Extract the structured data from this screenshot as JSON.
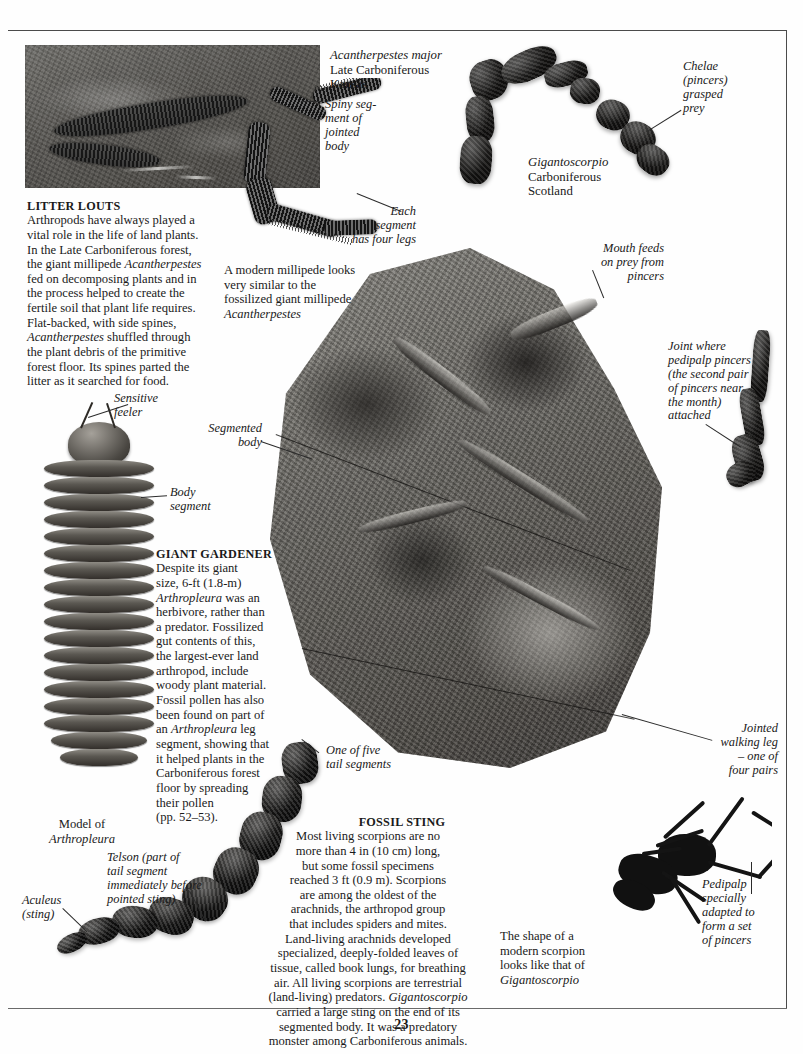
{
  "page": {
    "folio": "23"
  },
  "specimen_labels": {
    "millipede_fossil": {
      "species": "Acantherpestes major",
      "age": "Late Carboniferous",
      "place": "Kansas"
    },
    "scorpion_fossil": {
      "species": "Gigantoscorpio",
      "age": "Carboniferous",
      "place": "Scotland"
    }
  },
  "callouts": {
    "spiny_segment": "Spiny seg-\nment of\njointed\nbody",
    "each_segment": "Each\nsegment\nhas four legs",
    "chelae": "Chelae\n(pincers)\ngrasped\nprey",
    "mouth_feeds": "Mouth feeds\non prey from\npincers",
    "joint_where": "Joint where\npedipalp pincers\n(the second pair\nof pincers near\nthe month)\nattached",
    "sensitive_feeler": "Sensitive\nfeeler",
    "body_segment": "Body\nsegment",
    "segmented_body": "Segmented\nbody",
    "one_of_five": "One of five\ntail segments",
    "jointed_walking_leg": "Jointed\nwalking leg\n– one of\nfour pairs",
    "pedipalp": "Pedipalp\nspecially\nadapted to\nform a set\nof pincers",
    "telson": "Telson (part of\ntail segment\nimmediately before\npointed sting)",
    "aculeus": "Aculeus\n(sting)"
  },
  "captions": {
    "modern_millipede": "A modern millipede looks very similar to the fossilized giant millipede ",
    "modern_millipede_italic": "Acantherpestes",
    "model_of": "Model of",
    "model_of_italic": "Arthropleura",
    "modern_scorpion_shape": "The shape of a modern scorpion looks like that of ",
    "modern_scorpion_shape_italic": "Gigantoscorpio"
  },
  "articles": {
    "litter_louts": {
      "heading": "LITTER LOUTS",
      "lines": [
        "Arthropods have always played a",
        "vital role in the life of land plants.",
        "In the Late Carboniferous forest,",
        "the giant millipede #Acantherpestes#",
        "fed on decomposing plants and in",
        "the process helped to create the",
        "fertile soil that plant life requires.",
        "Flat-backed, with side spines,",
        "#Acantherpestes# shuffled through",
        "the plant debris of the primitive",
        "forest floor. Its spines parted the",
        "litter as it searched for food."
      ]
    },
    "giant_gardener": {
      "heading": "GIANT GARDENER",
      "lines": [
        "Despite its giant",
        "size, 6-ft (1.8-m)",
        "#Arthropleura# was an",
        "herbivore, rather than",
        "a predator. Fossilized",
        "gut contents of this,",
        "the largest-ever land",
        "arthropod, include",
        "woody plant material.",
        "Fossil pollen has also",
        "been found on part of",
        "an #Arthropleura# leg",
        "segment, showing that",
        "it helped plants in the",
        "Carboniferous forest",
        "floor by spreading",
        "their pollen",
        "(pp. 52–53)."
      ]
    },
    "fossil_sting": {
      "heading": "FOSSIL STING",
      "lines": [
        "Most living scorpions are no",
        "more than 4 in (10 cm) long,",
        "but some fossil specimens",
        "reached 3 ft (0.9 m). Scorpions",
        "are among the oldest of the",
        "arachnids, the arthropod group",
        "that includes spiders and mites.",
        "Land-living arachnids developed",
        "specialized, deeply-folded leaves of",
        "tissue, called book lungs, for breathing",
        "air. All living scorpions are terrestrial",
        "(land-living) predators. #Gigantoscorpio#",
        "carried a large sting on the end of its",
        "segmented body.  It was a predatory",
        "monster among Carboniferous animals."
      ]
    }
  }
}
